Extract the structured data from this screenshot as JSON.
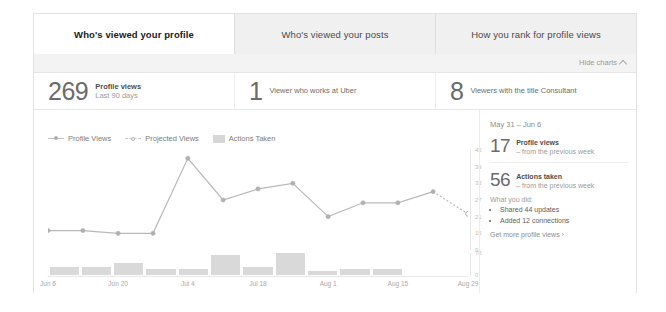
{
  "tabs": [
    {
      "label": "Who's viewed your profile",
      "active": true
    },
    {
      "label": "Who's viewed your posts",
      "active": false
    },
    {
      "label": "How you rank for profile views",
      "active": false
    }
  ],
  "hide_charts": {
    "label": "Hide charts",
    "icon": "chevron-up-icon"
  },
  "stats": [
    {
      "number": "269",
      "main": "Profile views",
      "sub": "Last 90 days"
    },
    {
      "number": "1",
      "plain": "Viewer who works at Uber"
    },
    {
      "number": "8",
      "plain": "Viewers with the title Consultant"
    }
  ],
  "legend": [
    {
      "label": "Profile Views",
      "marker": "solid-line-dot"
    },
    {
      "label": "Projected Views",
      "marker": "dashed-line-open-dot"
    },
    {
      "label": "Actions Taken",
      "marker": "gray-square"
    }
  ],
  "summary": {
    "week_range": "May 31 – Jun 6",
    "items": [
      {
        "number": "17",
        "main": "Profile views",
        "sub": "– from the previous week"
      },
      {
        "number": "56",
        "main": "Actions taken",
        "sub": "– from the previous week"
      }
    ],
    "what_you_did_label": "What you did:",
    "what_you_did": [
      "Shared 44 updates",
      "Added 12 connections"
    ],
    "get_more_label": "Get more profile views ›"
  },
  "colors": {
    "card_bg": "#f3f3f3",
    "panel_bg": "#ffffff",
    "line": "#b9b9b9",
    "marker": "#b0b0b0",
    "bar": "#d9d9d9",
    "text_dark": "#4a4a4a",
    "text_muted": "#9b9b9b"
  },
  "chart_data": {
    "type": "line",
    "title": "",
    "xlabel": "",
    "ylabel": "",
    "grid": false,
    "legend_position": "top-left",
    "x_tick_labels": [
      "Jun 6",
      "Jun 20",
      "Jul 4",
      "Jul 18",
      "Aug 1",
      "Aug 15",
      "Aug 29"
    ],
    "x_tick_positions": [
      0,
      16.7,
      33.3,
      50,
      66.7,
      83.3,
      100
    ],
    "y_tick_labels": [
      "45",
      "39",
      "33",
      "27",
      "21",
      "15",
      "9"
    ],
    "ylim": [
      9,
      45
    ],
    "series": [
      {
        "name": "Profile Views",
        "style": "solid",
        "x": [
          0,
          8.3,
          16.7,
          25,
          33.3,
          41.7,
          50,
          58.3,
          66.7,
          75,
          83.3,
          91.7
        ],
        "values": [
          16,
          16,
          15,
          15,
          42,
          27,
          31,
          33,
          21,
          26,
          26,
          30
        ]
      },
      {
        "name": "Projected Views",
        "style": "dashed",
        "x": [
          91.7,
          100
        ],
        "values": [
          30,
          22
        ],
        "note": "final open-circle marker is the projected point"
      }
    ],
    "bars": {
      "name": "Actions Taken",
      "ylim": [
        0,
        78
      ],
      "y_tick_labels": [
        "78",
        "0"
      ],
      "categories": [
        "Jun 6",
        "Jun 13",
        "Jun 20",
        "Jun 27",
        "Jul 4",
        "Jul 11",
        "Jul 18",
        "Jul 25",
        "Aug 1",
        "Aug 8",
        "Aug 15",
        "Aug 22",
        "Aug 29"
      ],
      "values": [
        30,
        30,
        42,
        22,
        22,
        72,
        30,
        78,
        14,
        22,
        22,
        0,
        0
      ]
    }
  }
}
